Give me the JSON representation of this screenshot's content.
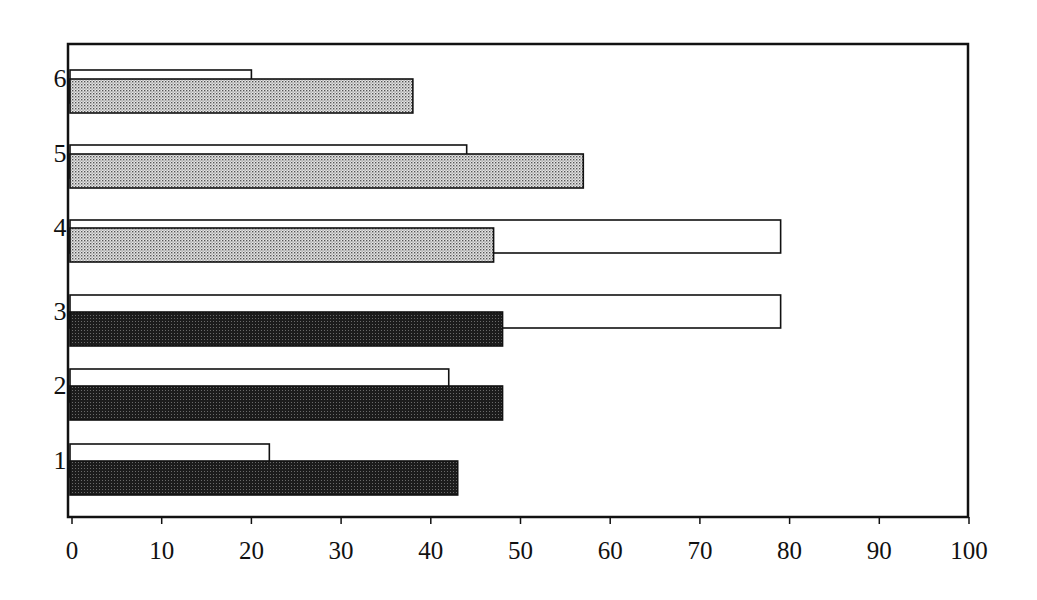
{
  "chart_data": {
    "type": "bar",
    "orientation": "horizontal",
    "title": "",
    "xlabel": "",
    "ylabel": "",
    "xlim": [
      0,
      100
    ],
    "x_ticks": [
      0,
      10,
      20,
      30,
      40,
      50,
      60,
      70,
      80,
      90,
      100
    ],
    "x_tick_labels": [
      "0",
      "10",
      "20",
      "30",
      "40",
      "50",
      "60",
      "70",
      "80",
      "90",
      "100"
    ],
    "categories": [
      "1",
      "2",
      "3",
      "4",
      "5",
      "6"
    ],
    "grid": false,
    "legend": null,
    "series": [
      {
        "name": "unfilled (white) bars",
        "fill": "white",
        "values": [
          22,
          42,
          79,
          79,
          44,
          20
        ]
      },
      {
        "name": "patterned bars",
        "fill_by_category": [
          "dark-stipple",
          "dark-stipple",
          "dark-stipple",
          "light-stipple",
          "light-stipple",
          "light-stipple"
        ],
        "values": [
          43,
          48,
          48,
          47,
          57,
          38
        ]
      }
    ]
  },
  "style": {
    "dark_fill": "#1a1a1a",
    "light_fill": "#c8c8c8",
    "stroke": "#111111",
    "background": "#ffffff"
  }
}
